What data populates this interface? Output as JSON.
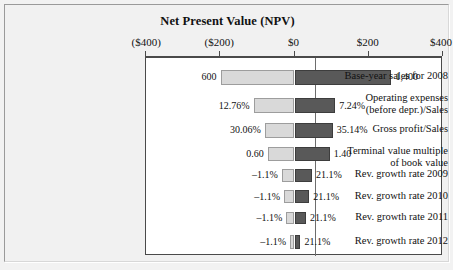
{
  "chart_data": {
    "type": "bar",
    "subtype": "tornado",
    "title": "Net Present Value (NPV)",
    "xlabel": "",
    "ylabel": "",
    "xlim": [
      -400,
      400
    ],
    "xticks": [
      -400,
      -200,
      0,
      200,
      400
    ],
    "xtick_labels": [
      "($400)",
      "($200)",
      "$0",
      "$200",
      "$400"
    ],
    "grid": false,
    "legend": "none",
    "categories": [
      "Base-year sales for 2008",
      "Operating expenses (before depr.)/Sales",
      "Gross profit/Sales",
      "Terminal value multiple of book value",
      "Rev. growth rate 2009",
      "Rev. growth rate 2010",
      "Rev. growth rate 2011",
      "Rev. growth rate 2012"
    ],
    "series": [
      {
        "name": "Low-side NPV",
        "values": [
          -199,
          -110,
          -80,
          -72,
          -34,
          -28,
          -22,
          -12
        ]
      },
      {
        "name": "High-side NPV",
        "values": [
          261,
          110,
          103,
          95,
          47,
          40,
          31,
          16
        ]
      }
    ],
    "input_labels_low": [
      "600",
      "12.76%",
      "30.06%",
      "0.60",
      "–1.1%",
      "–1.1%",
      "–1.1%",
      "–1.1%"
    ],
    "input_labels_high": [
      "1,400",
      "7.24%",
      "35.14%",
      "1.40",
      "21.1%",
      "21.1%",
      "21.1%",
      "21.1%"
    ]
  },
  "title": {
    "text": "Net Present Value (NPV)"
  },
  "axis": {
    "ticks": [
      {
        "label": "($400)",
        "x": 400
      },
      {
        "label": "($200)",
        "x": 200
      },
      {
        "label": "$0",
        "x": 0
      },
      {
        "label": "$200",
        "x": 200
      },
      {
        "label": "$400",
        "x": 400
      }
    ]
  },
  "rows": [
    {
      "label_line1": "Base-year sales for 2008",
      "label_line2": "",
      "low_value": "600",
      "high_value": "1,400"
    },
    {
      "label_line1": "Operating expenses",
      "label_line2": "(before depr.)/Sales",
      "low_value": "12.76%",
      "high_value": "7.24%"
    },
    {
      "label_line1": "Gross profit/Sales",
      "label_line2": "",
      "low_value": "30.06%",
      "high_value": "35.14%"
    },
    {
      "label_line1": "Terminal value multiple",
      "label_line2": "of book value",
      "low_value": "0.60",
      "high_value": "1.40"
    },
    {
      "label_line1": "Rev. growth rate 2009",
      "label_line2": "",
      "low_value": "–1.1%",
      "high_value": "21.1%"
    },
    {
      "label_line1": "Rev. growth rate 2010",
      "label_line2": "",
      "low_value": "–1.1%",
      "high_value": "21.1%"
    },
    {
      "label_line1": "Rev. growth rate 2011",
      "label_line2": "",
      "low_value": "–1.1%",
      "high_value": "21.1%"
    },
    {
      "label_line1": "Rev. growth rate 2012",
      "label_line2": "",
      "low_value": "–1.1%",
      "high_value": "21.1%"
    }
  ],
  "colors": {
    "low_bar": "#d9d9d9",
    "high_bar": "#595959",
    "background": "#f1f1f1",
    "plot_background": "#ffffff",
    "axis": "#4a4a4a"
  }
}
